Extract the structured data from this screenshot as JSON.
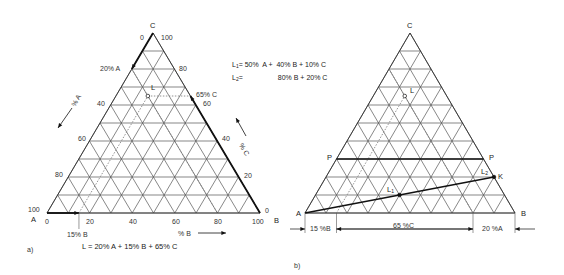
{
  "figure_a": {
    "panel_label": "a)",
    "corners": {
      "A": "A",
      "B": "B",
      "C": "C"
    },
    "geometry": {
      "A": [
        47,
        213
      ],
      "B": [
        260,
        213
      ],
      "C": [
        153,
        33
      ]
    },
    "left_edge_ticks": [
      "100",
      "80",
      "60",
      "40",
      "20% A",
      "0"
    ],
    "right_edge_ticks": [
      "0",
      "20",
      "40",
      "60",
      "80",
      "100"
    ],
    "bottom_ticks": [
      "0",
      "20",
      "40",
      "60",
      "80",
      "100"
    ],
    "axis_labels": {
      "percent_A": "% A",
      "percent_B": "% B",
      "percent_C": "% C"
    },
    "point_L": {
      "label": "L",
      "A": 20,
      "B": 15,
      "C": 65
    },
    "annotations": {
      "65_c": "65% C",
      "15_b": "15% B",
      "20_a": "20% A"
    },
    "formula": "L = 20% A + 15% B + 65% C"
  },
  "figure_b": {
    "panel_label": "b)",
    "corners": {
      "A": "A",
      "B": "B",
      "C": "C"
    },
    "geometry": {
      "A": [
        305,
        213
      ],
      "B": [
        515,
        213
      ],
      "C": [
        410,
        33
      ]
    },
    "point_L": {
      "label": "L"
    },
    "line_PP": {
      "left": "P",
      "right": "P",
      "level_C": 30
    },
    "point_K": {
      "label": "K"
    },
    "point_L1": {
      "label": "L",
      "sub": "1"
    },
    "point_L2": {
      "label": "L",
      "sub": "2"
    },
    "dimension_labels": {
      "b15": "15 %B",
      "c65": "65 %C",
      "a20": "20 %A"
    }
  },
  "legend": {
    "L1_name": "L",
    "L1_sub": "1",
    "L1_eq": "= 50%  A +  40% B + 10% C",
    "L2_name": "L",
    "L2_sub": "2",
    "L2_eq": "=                  80% B + 20% C"
  }
}
